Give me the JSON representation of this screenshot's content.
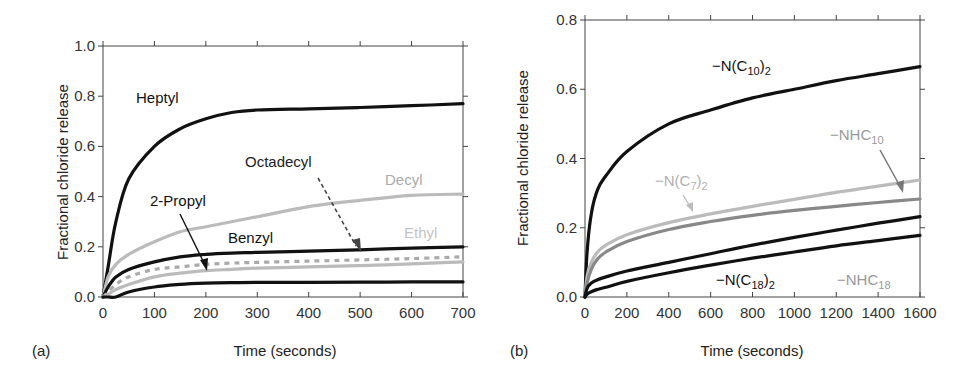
{
  "chart_data": [
    {
      "panel": "(a)",
      "type": "line",
      "title": "",
      "xlabel": "Time (seconds)",
      "ylabel": "Fractional chloride release",
      "xlim": [
        0,
        700
      ],
      "ylim": [
        0,
        1.0
      ],
      "xticks": [
        "0",
        "100",
        "200",
        "300",
        "400",
        "500",
        "600",
        "700"
      ],
      "yticks": [
        "0.0",
        "0.2",
        "0.4",
        "0.6",
        "0.8",
        "1.0"
      ],
      "grid": false,
      "legend": "inline annotations",
      "x": [
        0,
        10,
        25,
        50,
        100,
        150,
        200,
        250,
        300,
        400,
        500,
        600,
        700
      ],
      "series": [
        {
          "name": "Heptyl",
          "color": "#111111",
          "style": "solid",
          "values": [
            0.0,
            0.12,
            0.3,
            0.47,
            0.6,
            0.67,
            0.71,
            0.735,
            0.745,
            0.75,
            0.755,
            0.762,
            0.77
          ]
        },
        {
          "name": "Decyl",
          "color": "#bbbbbb",
          "style": "solid",
          "values": [
            0.0,
            0.08,
            0.13,
            0.17,
            0.22,
            0.26,
            0.28,
            0.3,
            0.32,
            0.36,
            0.385,
            0.405,
            0.41
          ]
        },
        {
          "name": "Benzyl",
          "color": "#111111",
          "style": "solid",
          "values": [
            0.0,
            0.04,
            0.08,
            0.11,
            0.14,
            0.16,
            0.17,
            0.175,
            0.178,
            0.183,
            0.188,
            0.195,
            0.2
          ]
        },
        {
          "name": "Octadecyl",
          "color": "#aaaaaa",
          "style": "dashed",
          "values": [
            0.0,
            0.02,
            0.05,
            0.08,
            0.11,
            0.12,
            0.13,
            0.135,
            0.138,
            0.143,
            0.148,
            0.153,
            0.16
          ]
        },
        {
          "name": "Ethyl",
          "color": "#bbbbbb",
          "style": "solid",
          "values": [
            0.0,
            0.01,
            0.03,
            0.05,
            0.08,
            0.095,
            0.105,
            0.11,
            0.115,
            0.12,
            0.125,
            0.132,
            0.14
          ]
        },
        {
          "name": "2-Propyl",
          "color": "#111111",
          "style": "solid",
          "values": [
            0.0,
            0.0,
            0.0,
            0.02,
            0.04,
            0.05,
            0.055,
            0.057,
            0.058,
            0.058,
            0.059,
            0.06,
            0.06
          ]
        }
      ],
      "annotations": [
        {
          "text": "Heptyl",
          "color": "#111111"
        },
        {
          "text": "Octadecyl",
          "color": "#111111",
          "arrow": "dashed"
        },
        {
          "text": "Decyl",
          "color": "#aaaaaa"
        },
        {
          "text": "2-Propyl",
          "color": "#111111",
          "arrow": "solid"
        },
        {
          "text": "Benzyl",
          "color": "#111111"
        },
        {
          "text": "Ethyl",
          "color": "#bbbbbb"
        }
      ]
    },
    {
      "panel": "(b)",
      "type": "line",
      "title": "",
      "xlabel": "Time (seconds)",
      "ylabel": "Fractional chloride release",
      "xlim": [
        0,
        1600
      ],
      "ylim": [
        0,
        0.8
      ],
      "xticks": [
        "0",
        "200",
        "400",
        "600",
        "800",
        "1000",
        "1200",
        "1400",
        "1600"
      ],
      "yticks": [
        "0.0",
        "0.2",
        "0.4",
        "0.6",
        "0.8"
      ],
      "grid": false,
      "legend": "inline annotations",
      "x": [
        0,
        10,
        30,
        60,
        100,
        200,
        400,
        600,
        800,
        1000,
        1200,
        1400,
        1600
      ],
      "series": [
        {
          "name": "-N(C10)2",
          "color": "#111111",
          "style": "solid",
          "values": [
            0.0,
            0.13,
            0.24,
            0.31,
            0.35,
            0.42,
            0.5,
            0.54,
            0.575,
            0.6,
            0.625,
            0.645,
            0.665
          ]
        },
        {
          "name": "-N(C7)2",
          "color": "#bbbbbb",
          "style": "solid",
          "values": [
            0.0,
            0.06,
            0.1,
            0.13,
            0.15,
            0.18,
            0.215,
            0.24,
            0.262,
            0.282,
            0.302,
            0.32,
            0.338
          ]
        },
        {
          "name": "-NHC10",
          "color": "#888888",
          "style": "solid",
          "values": [
            0.0,
            0.04,
            0.08,
            0.11,
            0.13,
            0.16,
            0.195,
            0.218,
            0.236,
            0.25,
            0.262,
            0.273,
            0.283
          ]
        },
        {
          "name": "-NHC18",
          "color": "#111111",
          "style": "solid",
          "values": [
            0.0,
            0.025,
            0.04,
            0.05,
            0.058,
            0.075,
            0.1,
            0.125,
            0.15,
            0.172,
            0.193,
            0.213,
            0.232
          ]
        },
        {
          "name": "-N(C18)2",
          "color": "#111111",
          "style": "solid",
          "values": [
            0.0,
            0.008,
            0.015,
            0.022,
            0.028,
            0.045,
            0.07,
            0.092,
            0.112,
            0.13,
            0.148,
            0.163,
            0.178
          ]
        }
      ],
      "annotations": [
        {
          "text": "−N(C10)2",
          "color": "#111111"
        },
        {
          "text": "−NHC10",
          "color": "#999999",
          "arrow": "solid"
        },
        {
          "text": "−N(C7)2",
          "color": "#aaaaaa",
          "arrow": "solid"
        },
        {
          "text": "−N(C18)2",
          "color": "#111111"
        },
        {
          "text": "−NHC18",
          "color": "#999999"
        }
      ]
    }
  ],
  "panels": {
    "a": {
      "label": "(a)",
      "xlabel": "Time (seconds)",
      "ylabel": "Fractional chloride release",
      "labels": {
        "heptyl": "Heptyl",
        "octadecyl": "Octadecyl",
        "decyl": "Decyl",
        "propyl": "2-Propyl",
        "benzyl": "Benzyl",
        "ethyl": "Ethyl"
      }
    },
    "b": {
      "label": "(b)",
      "xlabel": "Time (seconds)",
      "ylabel": "Fractional chloride release",
      "labels": {
        "nc10_main": "−N(C",
        "nc10_sub": "10",
        "nc10_tail": ")",
        "nc10_sub2": "2",
        "nhc10_main": "−NHC",
        "nhc10_sub": "10",
        "nc7_main": "−N(C",
        "nc7_sub": "7",
        "nc7_tail": ")",
        "nc7_sub2": "2",
        "nc18_main": "−N(C",
        "nc18_sub": "18",
        "nc18_tail": ")",
        "nc18_sub2": "2",
        "nhc18_main": "−NHC",
        "nhc18_sub": "18"
      }
    }
  }
}
